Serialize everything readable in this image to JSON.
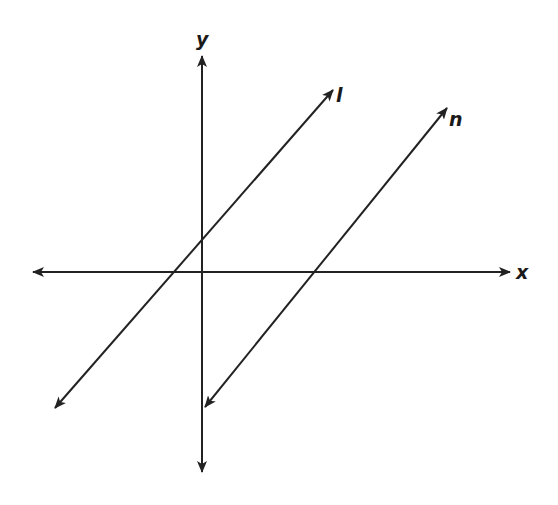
{
  "diagram": {
    "type": "coordinate-plane-parallel-lines",
    "stroke_color": "#222222",
    "background": "#ffffff",
    "axes": {
      "x": {
        "label": "x",
        "from": [
          33,
          272
        ],
        "to": [
          510,
          272
        ]
      },
      "y": {
        "label": "y",
        "from": [
          202,
          472
        ],
        "to": [
          202,
          56
        ]
      }
    },
    "lines": [
      {
        "name": "l",
        "label": "l",
        "from": [
          55,
          408
        ],
        "to": [
          333,
          90
        ],
        "passes_through": "origin"
      },
      {
        "name": "n",
        "label": "n",
        "from": [
          205,
          407
        ],
        "to": [
          447,
          108
        ],
        "x_intercept_px": [
          337,
          272
        ]
      }
    ],
    "labels": {
      "y": "y",
      "x": "x",
      "l": "l",
      "n": "n"
    }
  }
}
